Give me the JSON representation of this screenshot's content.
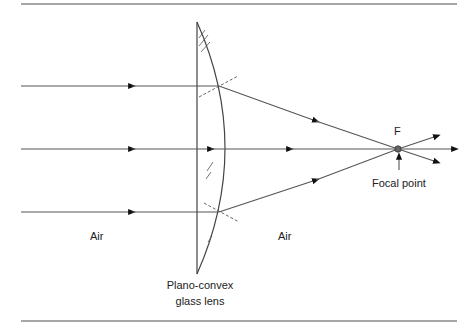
{
  "diagram": {
    "labels": {
      "air_left": "Air",
      "air_right": "Air",
      "focus_letter": "F",
      "focal_point": "Focal point",
      "lens_line1": "Plano-convex",
      "lens_line2": "glass lens"
    },
    "rays": [
      {
        "name": "top-ray",
        "y": 86
      },
      {
        "name": "middle-ray",
        "y": 149
      },
      {
        "name": "bottom-ray",
        "y": 212
      }
    ],
    "focal_point": {
      "x": 398,
      "y": 149
    },
    "colors": {
      "line": "#555555",
      "rule": "#888888",
      "arrow": "#111111",
      "focus_dot": "#666666"
    }
  }
}
